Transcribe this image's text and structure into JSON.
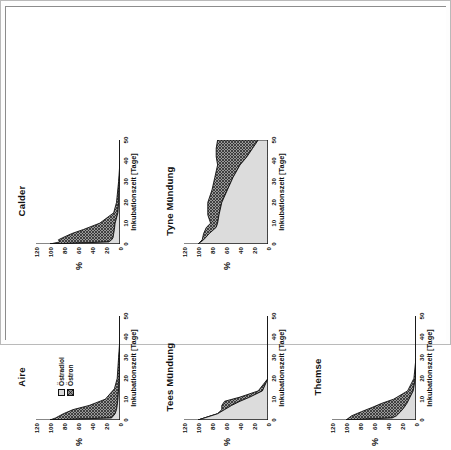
{
  "figure": {
    "legend": {
      "items": [
        {
          "label": "Östradiol",
          "swatch": "light-square-icon",
          "color": "#d9d9d9"
        },
        {
          "label": "Östron",
          "swatch": "hatched-square-icon",
          "color": "#8e8e8e"
        }
      ]
    },
    "axis": {
      "xlabel": "Inkubationszeit  [Tage]",
      "ylabel": "%",
      "xticks": [
        "0",
        "10",
        "20",
        "30",
        "40",
        "50"
      ],
      "yticks": [
        "0",
        "20",
        "40",
        "60",
        "80",
        "100",
        "120"
      ]
    }
  },
  "chart_data": [
    {
      "type": "area",
      "title": "Aire",
      "xlabel": "Inkubationszeit  [Tage]",
      "ylabel": "%",
      "xlim": [
        0,
        50
      ],
      "ylim": [
        0,
        120
      ],
      "xticks": [
        0,
        10,
        20,
        30,
        40,
        50
      ],
      "yticks": [
        0,
        20,
        40,
        60,
        80,
        100,
        120
      ],
      "grid": false,
      "stacked": true,
      "legend_position": "inside-upper-left",
      "x": [
        0,
        1,
        3,
        5,
        7,
        10,
        15,
        20,
        30,
        40,
        50
      ],
      "series": [
        {
          "name": "Östradiol",
          "values": [
            100,
            12,
            7,
            5,
            4,
            3,
            2,
            1,
            1,
            0,
            0
          ]
        },
        {
          "name": "Östron",
          "values": [
            0,
            80,
            74,
            62,
            40,
            18,
            6,
            3,
            1,
            0,
            0
          ]
        }
      ]
    },
    {
      "type": "area",
      "title": "Calder",
      "xlabel": "Inkubationszeit  [Tage]",
      "ylabel": "%",
      "xlim": [
        0,
        50
      ],
      "ylim": [
        0,
        120
      ],
      "xticks": [
        0,
        10,
        20,
        30,
        40,
        50
      ],
      "yticks": [
        0,
        20,
        40,
        60,
        80,
        100,
        120
      ],
      "grid": false,
      "stacked": true,
      "legend_position": "none",
      "x": [
        0,
        1,
        2,
        3,
        5,
        7,
        10,
        15,
        20,
        30,
        40,
        50
      ],
      "series": [
        {
          "name": "Östradiol",
          "values": [
            100,
            16,
            12,
            10,
            9,
            8,
            7,
            3,
            2,
            1,
            0,
            0
          ]
        },
        {
          "name": "Östron",
          "values": [
            0,
            70,
            76,
            72,
            60,
            44,
            22,
            6,
            3,
            1,
            0,
            0
          ]
        }
      ]
    },
    {
      "type": "area",
      "title": "Tees Mündung",
      "xlabel": "Inkubationszeit  [Tage]",
      "ylabel": "%",
      "xlim": [
        0,
        50
      ],
      "ylim": [
        0,
        120
      ],
      "xticks": [
        0,
        10,
        20,
        30,
        40,
        50
      ],
      "yticks": [
        0,
        20,
        40,
        60,
        80,
        100,
        120
      ],
      "grid": false,
      "stacked": true,
      "legend_position": "none",
      "x": [
        0,
        3,
        5,
        7,
        9,
        11,
        14,
        20,
        30,
        40,
        50
      ],
      "series": [
        {
          "name": "Östradiol",
          "values": [
            100,
            72,
            62,
            52,
            40,
            26,
            8,
            0,
            0,
            0,
            0
          ]
        },
        {
          "name": "Östron",
          "values": [
            0,
            0,
            4,
            14,
            22,
            14,
            6,
            0,
            0,
            0,
            0
          ]
        }
      ]
    },
    {
      "type": "area",
      "title": "Tyne Mündung",
      "xlabel": "Inkubationszeit  [Tage]",
      "ylabel": "%",
      "xlim": [
        0,
        50
      ],
      "ylim": [
        0,
        120
      ],
      "xticks": [
        0,
        10,
        20,
        30,
        40,
        50
      ],
      "yticks": [
        0,
        20,
        40,
        60,
        80,
        100,
        120
      ],
      "grid": false,
      "stacked": true,
      "legend_position": "none",
      "x": [
        0,
        2,
        5,
        8,
        10,
        14,
        20,
        26,
        32,
        38,
        42,
        46,
        50
      ],
      "series": [
        {
          "name": "Östradiol",
          "values": [
            100,
            92,
            84,
            74,
            72,
            70,
            66,
            58,
            50,
            40,
            30,
            22,
            14
          ]
        },
        {
          "name": "Östron",
          "values": [
            0,
            2,
            8,
            14,
            10,
            16,
            20,
            22,
            26,
            32,
            44,
            52,
            58
          ]
        }
      ]
    },
    {
      "type": "area",
      "title": "Themse",
      "xlabel": "Inkubationszeit  [Tage]",
      "ylabel": "%",
      "xlim": [
        0,
        50
      ],
      "ylim": [
        0,
        120
      ],
      "xticks": [
        0,
        10,
        20,
        30,
        40,
        50
      ],
      "yticks": [
        0,
        20,
        40,
        60,
        80,
        100,
        120
      ],
      "grid": false,
      "stacked": true,
      "legend_position": "none",
      "x": [
        0,
        1,
        2,
        4,
        6,
        8,
        10,
        14,
        20,
        30,
        40,
        50
      ],
      "series": [
        {
          "name": "Östradiol",
          "values": [
            100,
            34,
            28,
            22,
            17,
            13,
            10,
            4,
            1,
            0,
            0,
            0
          ]
        },
        {
          "name": "Östron",
          "values": [
            0,
            62,
            64,
            56,
            46,
            36,
            22,
            8,
            2,
            0,
            0,
            0
          ]
        }
      ]
    }
  ]
}
